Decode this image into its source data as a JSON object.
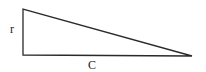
{
  "diagram": {
    "type": "right-triangle",
    "labels": {
      "vertical_leg": "r",
      "horizontal_leg": "C"
    },
    "stroke_color": "#2a2a2a"
  }
}
